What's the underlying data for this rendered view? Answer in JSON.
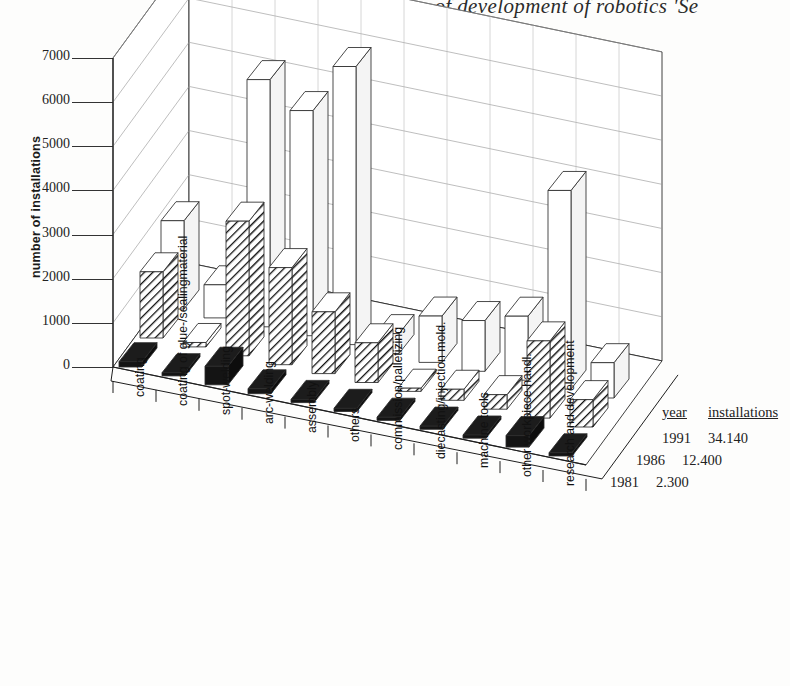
{
  "title": "The course of development of robotics 'Se",
  "axis": {
    "ylabel": "number of installations",
    "yticks": [
      "0",
      "1000",
      "2000",
      "3000",
      "4000",
      "5000",
      "6000",
      "7000"
    ]
  },
  "legend": {
    "header_year": "year",
    "header_installations": "installations",
    "rows": [
      {
        "year": "1991",
        "installations": "34.140"
      },
      {
        "year": "1986",
        "installations": "12.400"
      },
      {
        "year": "1981",
        "installations": "2.300"
      }
    ]
  },
  "chart_data": {
    "type": "bar",
    "title": "The course of development of robotics 'Se",
    "xlabel": "",
    "ylabel": "number of installations",
    "ylim": [
      0,
      7000
    ],
    "grid": true,
    "legend_position": "right",
    "categories": [
      "coating",
      "coating of glue-/sealingmaterial",
      "spot-welding",
      "arc-welding",
      "assembly",
      "others",
      "commission/palletizing",
      "diecasting/injection mold.",
      "machine tools",
      "other workpiece handl.",
      "research and development"
    ],
    "series": [
      {
        "name": "1981",
        "total": "2.300",
        "values": [
          120,
          60,
          420,
          110,
          70,
          60,
          30,
          40,
          60,
          260,
          40
        ]
      },
      {
        "name": "1986",
        "total": "12.400",
        "values": [
          1500,
          100,
          3050,
          2200,
          1400,
          900,
          60,
          250,
          330,
          1750,
          620
        ]
      },
      {
        "name": "1991",
        "total": "34.140",
        "values": [
          2000,
          750,
          5600,
          5100,
          6300,
          450,
          1050,
          1150,
          1450,
          4500,
          800
        ]
      }
    ]
  }
}
